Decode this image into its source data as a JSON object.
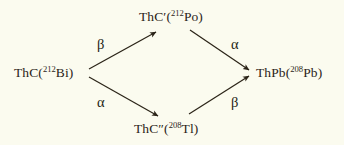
{
  "figure": {
    "kind": "radioactive-decay-branching-diagram",
    "background_color": "#fbfbef",
    "text_color": "#2b2418",
    "line_color": "#2b2418"
  },
  "nodes": {
    "parent": {
      "id": "ThC",
      "symbol": "ThC",
      "prime": "",
      "open_paren": "(",
      "mass_number": "212",
      "element": "Bi",
      "close_paren": ")",
      "full_text": "ThC(212Bi)"
    },
    "branch_top": {
      "id": "ThC-prime",
      "symbol": "ThC",
      "prime": "′",
      "open_paren": "(",
      "mass_number": "212",
      "element": "Po",
      "close_paren": ")",
      "full_text": "ThC′(212Po)"
    },
    "branch_bottom": {
      "id": "ThC-double-prime",
      "symbol": "ThC",
      "prime": "″",
      "open_paren": "(",
      "mass_number": "208",
      "element": "Tl",
      "close_paren": ")",
      "full_text": "ThC″(208Tl)"
    },
    "product": {
      "id": "ThPb",
      "symbol": "ThPb",
      "prime": "",
      "open_paren": "(",
      "mass_number": "208",
      "element": "Pb",
      "close_paren": ")",
      "full_text": "ThPb(208Pb)"
    }
  },
  "decay_labels": {
    "parent_to_top": "β",
    "top_to_product": "α",
    "parent_to_bottom": "α",
    "bottom_to_product": "β"
  },
  "arrows": [
    {
      "name": "parent-to-branch-top",
      "from": "ThC",
      "to": "ThC′",
      "decay": "β",
      "x1": 89,
      "y1": 69,
      "x2": 156,
      "y2": 32
    },
    {
      "name": "branch-top-to-product",
      "from": "ThC′",
      "to": "ThPb",
      "decay": "α",
      "x1": 190,
      "y1": 30,
      "x2": 249,
      "y2": 70
    },
    {
      "name": "parent-to-branch-bottom",
      "from": "ThC",
      "to": "ThC″",
      "decay": "α",
      "x1": 89,
      "y1": 77,
      "x2": 158,
      "y2": 116
    },
    {
      "name": "branch-bottom-to-product",
      "from": "ThC″",
      "to": "ThPb",
      "decay": "β",
      "x1": 189,
      "y1": 114,
      "x2": 249,
      "y2": 76
    }
  ]
}
